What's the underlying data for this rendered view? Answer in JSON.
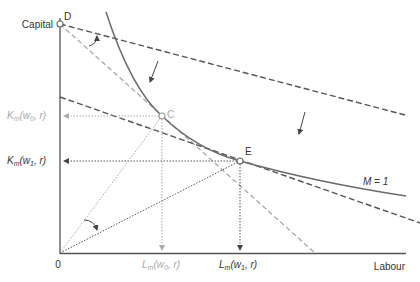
{
  "diagram": {
    "axes": {
      "y_label": "Capital",
      "x_label": "Labour",
      "origin_label": "0"
    },
    "points": {
      "D": "D",
      "C": "C",
      "E": "E"
    },
    "isoquant_label": "M = 1",
    "y_ticks": {
      "k_w0": {
        "main": "K",
        "sub": "m",
        "args": "(w",
        "argsub": "0",
        "tail": ", r)"
      },
      "k_w1": {
        "main": "K",
        "sub": "m",
        "args": "(w",
        "argsub": "1",
        "tail": ", r)"
      }
    },
    "x_ticks": {
      "l_w0": {
        "main": "L",
        "sub": "m",
        "args": "(w",
        "argsub": "0",
        "tail": ", r)"
      },
      "l_w1": {
        "main": "L",
        "sub": "m",
        "args": "(w",
        "argsub": "1",
        "tail": ", r)"
      }
    },
    "colors": {
      "dark": "#555555",
      "light": "#a8a8a8",
      "curve": "#6a6a6a",
      "text": "#333333"
    }
  }
}
